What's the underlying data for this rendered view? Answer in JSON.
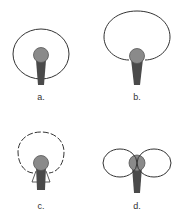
{
  "diagram": {
    "colors": {
      "outline": "#333333",
      "mic_head": "#8a8a8a",
      "mic_head_stroke": "#555555",
      "mic_handle": "#4a4a4a",
      "background": "#ffffff"
    },
    "panels": [
      {
        "id": "a",
        "label": "a.",
        "pattern": "omnidirectional",
        "line_style": "solid"
      },
      {
        "id": "b",
        "label": "b.",
        "pattern": "cardioid",
        "line_style": "solid"
      },
      {
        "id": "c",
        "label": "c.",
        "pattern": "hypercardioid",
        "line_style": "dashed"
      },
      {
        "id": "d",
        "label": "d.",
        "pattern": "bidirectional (figure-8)",
        "line_style": "solid"
      }
    ]
  }
}
